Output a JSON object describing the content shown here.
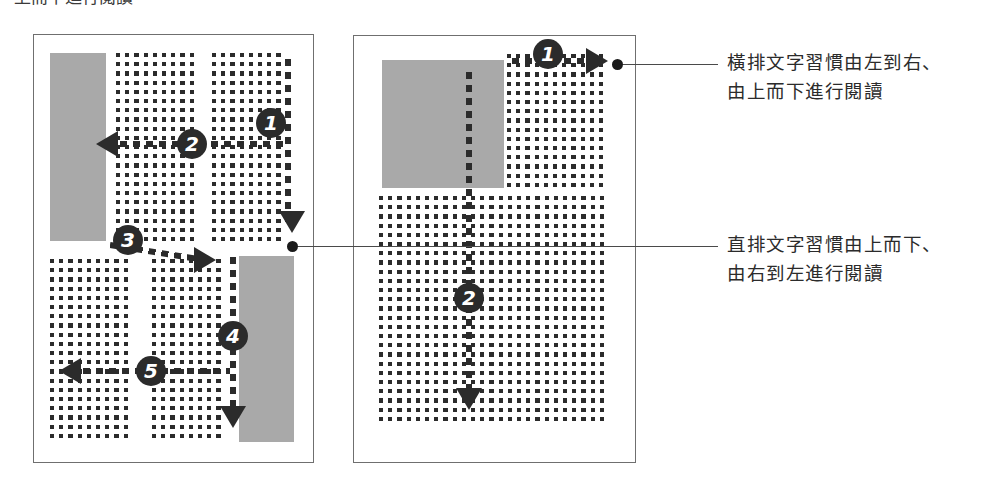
{
  "figure": {
    "clipped_title": "上而下進行閱讀",
    "panels": [
      {
        "id": "vertical-layout-panel",
        "name": "直排版面",
        "markers": [
          "1",
          "2",
          "3",
          "4",
          "5"
        ],
        "blocks": [
          "上方直式圖片區塊",
          "下方直式圖片區塊"
        ],
        "reading_direction": "由上而下、由右到左"
      },
      {
        "id": "horizontal-layout-panel",
        "name": "橫排版面",
        "markers": [
          "1",
          "2"
        ],
        "blocks": [
          "左上方方形圖片區塊"
        ],
        "reading_direction": "由左到右、由上而下"
      }
    ]
  },
  "callouts": [
    {
      "id": "horizontal-reading-callout",
      "lines": [
        "橫排文字習慣由左到右、",
        "由上而下進行閱讀"
      ]
    },
    {
      "id": "vertical-reading-callout",
      "lines": [
        "直排文字習慣由上而下、",
        "由右到左進行閱讀"
      ]
    }
  ],
  "colors": {
    "ink": "#2b2b2b",
    "block_gray": "#a9a9a9",
    "panel_border": "#6f6f6f",
    "leader": "#4a4a4a"
  }
}
